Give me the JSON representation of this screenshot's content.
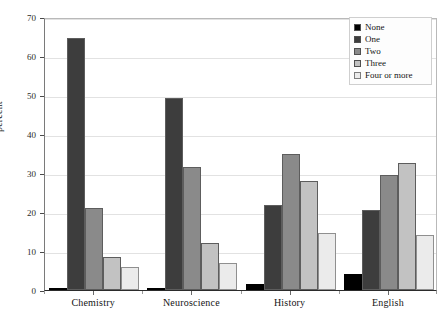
{
  "chart_data": {
    "type": "bar",
    "title": "",
    "subtitle": "",
    "xlabel": "",
    "ylabel": "percent",
    "ylim": [
      0,
      70
    ],
    "yticks": [
      0,
      10,
      20,
      30,
      40,
      50,
      60,
      70
    ],
    "ytick_labels": [
      "0",
      "10",
      "20",
      "30",
      "40",
      "50",
      "60",
      "70"
    ],
    "grid": true,
    "legend_position": "top-right",
    "legend_title": "",
    "categories": [
      "Chemistry",
      "Neuroscience",
      "History",
      "English"
    ],
    "series": [
      {
        "name": "None",
        "color": "#000000",
        "values": [
          0.5,
          0.6,
          1.5,
          4.0
        ]
      },
      {
        "name": "One",
        "color": "#3d3d3d",
        "values": [
          64.5,
          49.3,
          21.8,
          20.5
        ]
      },
      {
        "name": "Two",
        "color": "#8a8a8a",
        "values": [
          21.0,
          31.5,
          35.0,
          29.5
        ]
      },
      {
        "name": "Three",
        "color": "#c2c2c2",
        "values": [
          8.5,
          12.0,
          28.0,
          32.5
        ]
      },
      {
        "name": "Four or more",
        "color": "#ebebeb",
        "values": [
          6.0,
          7.0,
          14.5,
          14.0
        ]
      }
    ]
  },
  "legend": {
    "items": [
      {
        "label": "None"
      },
      {
        "label": "One"
      },
      {
        "label": "Two"
      },
      {
        "label": "Three"
      },
      {
        "label": "Four or more"
      }
    ]
  },
  "axes": {
    "y_title": "percent"
  }
}
